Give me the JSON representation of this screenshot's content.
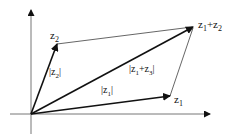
{
  "diagram": {
    "labels": {
      "z1": "z",
      "z1_sub": "1",
      "z2": "z",
      "z2_sub": "2",
      "sum_z": "z",
      "sum_sub1": "1",
      "sum_plus": "+z",
      "sum_sub2": "2",
      "mod_z1_open": "|z",
      "mod_z1_sub": "1",
      "mod_z1_close": "|",
      "mod_z2_open": "|z",
      "mod_z2_sub": "2",
      "mod_z2_close": "|",
      "mod_sum_open": "|z",
      "mod_sum_sub1": "1",
      "mod_sum_plus": "+z",
      "mod_sum_sub2": "3",
      "mod_sum_close": "|"
    },
    "colors": {
      "stroke": "#111111",
      "thin": "#555555",
      "axis": "#777777"
    }
  }
}
